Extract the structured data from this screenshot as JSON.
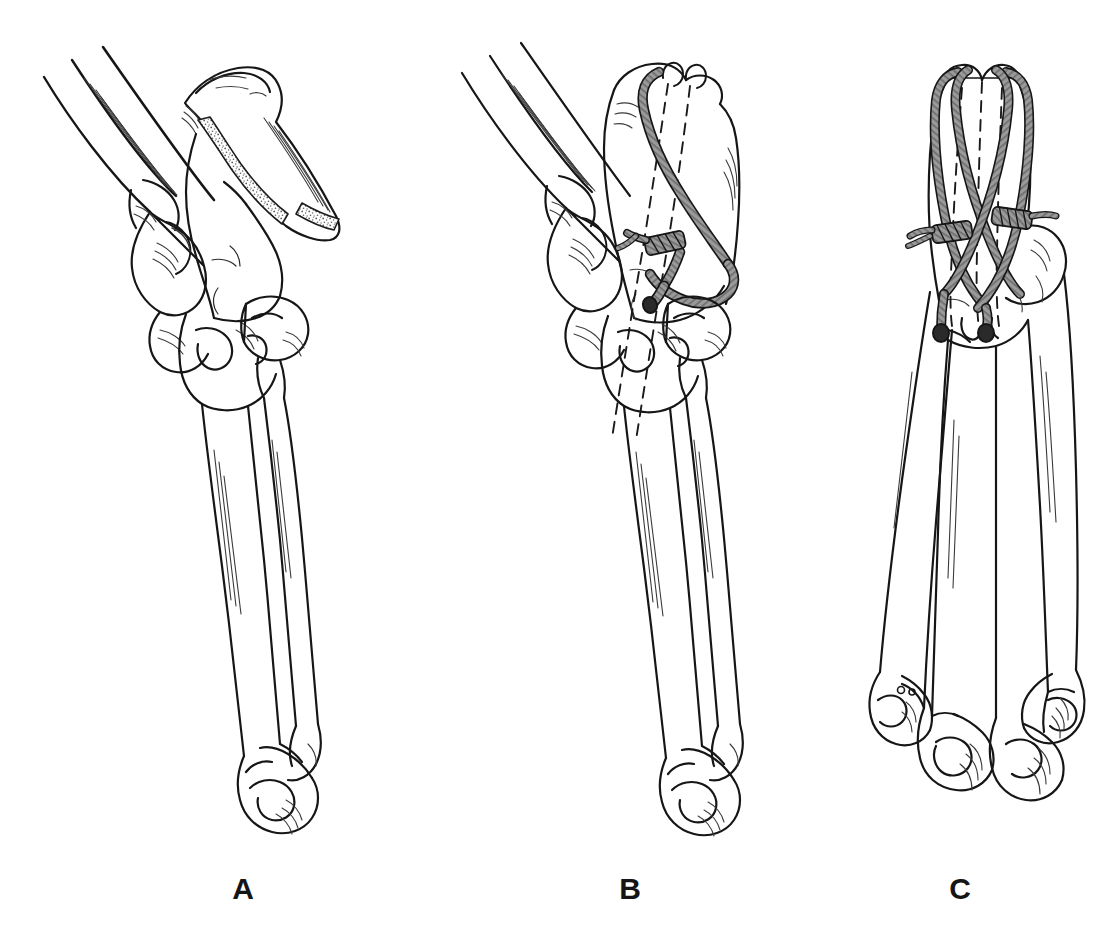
{
  "figure": {
    "background_color": "#ffffff",
    "line_color": "#161616",
    "wire_color": "#8d8d8d",
    "wire_outline_color": "#1a1a1a",
    "cancellous_stipple_color": "#4a4a4a",
    "width": 1107,
    "height": 939
  },
  "panels": [
    {
      "id": "A",
      "label": "A",
      "label_x": 243,
      "label_y": 890,
      "caption_implied": "Displaced olecranon fracture with proximal fragment retracted by triceps pull",
      "view": "lateral",
      "structures": [
        "humerus-shaft",
        "distal-humerus-trochlea",
        "displaced-olecranon-fragment",
        "fracture-surface-cancellous",
        "ulna-proximal",
        "radial-head",
        "radius-shaft",
        "ulna-shaft",
        "distal-radius",
        "distal-ulna-styloid"
      ],
      "hardware": []
    },
    {
      "id": "B",
      "label": "B",
      "label_x": 630,
      "label_y": 890,
      "caption_implied": "Fracture reduced and fixed with two parallel K-wires and a figure-of-eight tension band wire",
      "view": "lateral",
      "structures": [
        "humerus-shaft",
        "distal-humerus-trochlea",
        "reduced-olecranon",
        "ulna-proximal",
        "radial-head",
        "radius-shaft",
        "ulna-shaft",
        "distal-radius",
        "distal-ulna-styloid"
      ],
      "hardware": [
        "kirschner-wire-1",
        "kirschner-wire-2",
        "tension-band-wire-figure-eight",
        "wire-twist-knot"
      ],
      "kirschner_wire_count": 2,
      "wire_knot_count": 1
    },
    {
      "id": "C",
      "label": "C",
      "label_x": 960,
      "label_y": 890,
      "caption_implied": "Posterior view showing the crossed figure-of-eight tension band with two twist knots",
      "view": "posterior",
      "structures": [
        "olecranon-posterior",
        "ulna-shaft",
        "radius-shaft",
        "distal-radius",
        "distal-ulna",
        "distal-radius-second",
        "distal-ulna-second"
      ],
      "hardware": [
        "kirschner-wire-1",
        "kirschner-wire-2",
        "tension-band-wire-crossed-loop-left",
        "tension-band-wire-crossed-loop-right",
        "wire-twist-knot-left",
        "wire-twist-knot-right"
      ],
      "kirschner_wire_count": 2,
      "wire_knot_count": 2
    }
  ],
  "labels": {
    "a": "A",
    "b": "B",
    "c": "C"
  }
}
